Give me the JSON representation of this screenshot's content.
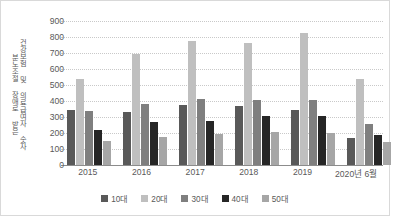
{
  "chart_data": {
    "type": "bar",
    "title": "",
    "xlabel": "",
    "ylabel": "분노조절 장애로 받은 건강보험 및 의료급여자 숫자",
    "ylabel_lines": [
      "분노조절 장애로 받은",
      "건강보험 및 의료급여자 숫자"
    ],
    "categories": [
      "2015",
      "2016",
      "2017",
      "2018",
      "2019",
      "2020년 6월"
    ],
    "series": [
      {
        "name": "10대",
        "color": "#595959",
        "values": [
          343,
          331,
          378,
          366,
          346,
          168
        ]
      },
      {
        "name": "20대",
        "color": "#bfbfbf",
        "values": [
          535,
          695,
          775,
          763,
          822,
          540
        ]
      },
      {
        "name": "30대",
        "color": "#7f7f7f",
        "values": [
          338,
          382,
          412,
          408,
          406,
          254
        ]
      },
      {
        "name": "40대",
        "color": "#262626",
        "values": [
          220,
          268,
          275,
          306,
          308,
          186
        ]
      },
      {
        "name": "50대",
        "color": "#a6a6a6",
        "values": [
          147,
          172,
          193,
          206,
          200,
          146
        ]
      }
    ],
    "ylim": [
      0,
      900
    ],
    "yticks": [
      0,
      100,
      200,
      300,
      400,
      500,
      600,
      700,
      800,
      900
    ],
    "ytick_labels": [
      "0",
      "100",
      "200",
      "300",
      "400",
      "500",
      "600",
      "700",
      "800",
      "900"
    ],
    "grid": true,
    "legend_position": "bottom",
    "axis_color": "#8c8c8c",
    "grid_color": "#c9c9c9",
    "text_color": "#595959"
  }
}
